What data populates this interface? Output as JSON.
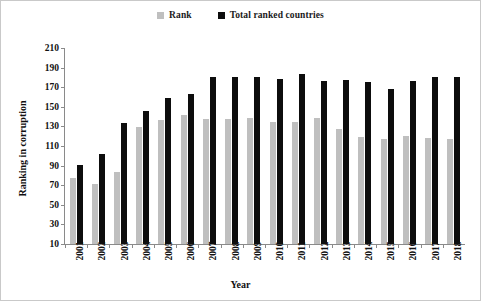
{
  "chart_data": {
    "type": "bar",
    "title": "",
    "xlabel": "Year",
    "ylabel": "Ranking in corruption",
    "categories": [
      "2001",
      "2002",
      "2003",
      "2004",
      "2005",
      "2006",
      "2007",
      "2008",
      "2009",
      "2010",
      "2011",
      "2012",
      "2013",
      "2014",
      "2015",
      "2016",
      "2017",
      "2018"
    ],
    "series": [
      {
        "name": "Rank",
        "color": "#bfbfbf",
        "values": [
          77,
          71,
          83,
          129,
          137,
          142,
          138,
          138,
          139,
          134,
          134,
          139,
          127,
          119,
          117,
          120,
          118,
          117
        ]
      },
      {
        "name": "Total ranked countries",
        "color": "#0d0d0d",
        "values": [
          91,
          102,
          133,
          146,
          159,
          163,
          180,
          180,
          180,
          178,
          183,
          176,
          177,
          175,
          168,
          176,
          180,
          180
        ]
      }
    ],
    "ylim": [
      10,
      210
    ],
    "yticks": [
      10,
      30,
      50,
      70,
      90,
      110,
      130,
      150,
      170,
      190,
      210
    ],
    "grid": false,
    "legend_position": "top-center"
  },
  "legend": {
    "items": [
      {
        "label": "Rank",
        "color": "#bfbfbf"
      },
      {
        "label": "Total ranked countries",
        "color": "#0d0d0d"
      }
    ]
  },
  "axes": {
    "y_title": "Ranking in corruption",
    "x_title": "Year"
  }
}
